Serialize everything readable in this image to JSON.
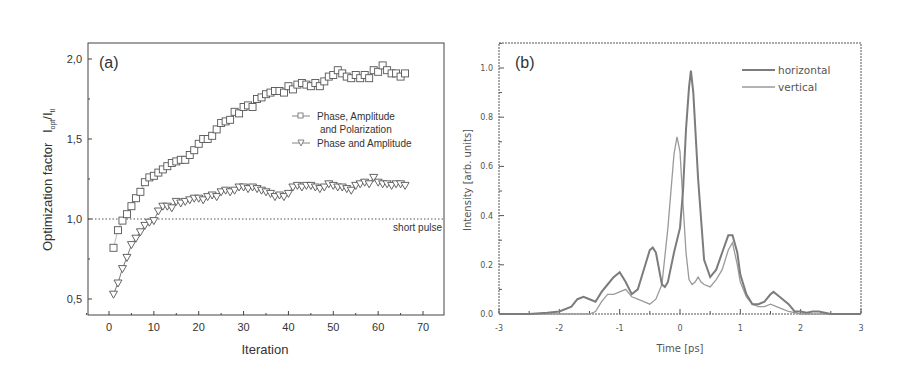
{
  "chart_data": [
    {
      "panel": "(a)",
      "type": "scatter",
      "title": "",
      "panel_label": "(a)",
      "xlabel": "Iteration",
      "ylabel": "Optimization factor  I_opt/I_tl",
      "ylabel_main": "Optimization factor",
      "ylabel_I": "I",
      "ylabel_sub1": "opt",
      "ylabel_sub2": "tl",
      "xlim": [
        -5,
        75
      ],
      "ylim": [
        0.4,
        2.1
      ],
      "xticks": [
        0,
        10,
        20,
        30,
        40,
        50,
        60,
        70
      ],
      "xtick_labels": [
        "0",
        "10",
        "20",
        "30",
        "40",
        "50",
        "60",
        "70"
      ],
      "yticks": [
        0.5,
        1.0,
        1.5,
        2.0
      ],
      "ytick_labels": [
        "0,5",
        "1,0",
        "1,5",
        "2,0"
      ],
      "grid": false,
      "legend_position": "upper right (inside)",
      "reference_line": {
        "y": 1.0,
        "style": "dotted",
        "label": "short pulse"
      },
      "series": [
        {
          "name": "Phase, Amplitude and Polarization",
          "legend_line1": "Phase, Amplitude",
          "legend_line2": "and Polarization",
          "marker": "square",
          "x": [
            1,
            2,
            3,
            4,
            5,
            6,
            7,
            8,
            9,
            10,
            11,
            12,
            13,
            14,
            15,
            16,
            17,
            18,
            19,
            20,
            21,
            22,
            23,
            24,
            25,
            26,
            27,
            28,
            29,
            30,
            31,
            32,
            33,
            34,
            35,
            36,
            37,
            38,
            39,
            40,
            41,
            42,
            43,
            44,
            45,
            46,
            47,
            48,
            49,
            50,
            51,
            52,
            53,
            54,
            55,
            56,
            57,
            58,
            59,
            60,
            61,
            62,
            63,
            64,
            65,
            66
          ],
          "y": [
            0.82,
            0.93,
            0.99,
            1.03,
            1.08,
            1.13,
            1.17,
            1.23,
            1.26,
            1.27,
            1.29,
            1.31,
            1.33,
            1.35,
            1.36,
            1.37,
            1.37,
            1.4,
            1.43,
            1.47,
            1.5,
            1.5,
            1.52,
            1.56,
            1.6,
            1.61,
            1.62,
            1.67,
            1.66,
            1.7,
            1.71,
            1.7,
            1.75,
            1.76,
            1.78,
            1.79,
            1.8,
            1.8,
            1.79,
            1.83,
            1.81,
            1.84,
            1.85,
            1.84,
            1.83,
            1.85,
            1.83,
            1.86,
            1.89,
            1.9,
            1.93,
            1.91,
            1.89,
            1.88,
            1.9,
            1.88,
            1.9,
            1.88,
            1.93,
            1.92,
            1.96,
            1.93,
            1.91,
            1.91,
            1.89,
            1.91
          ]
        },
        {
          "name": "Phase and Amplitude",
          "legend_line1": "Phase and Amplitude",
          "marker": "triangle-down",
          "x": [
            1,
            2,
            3,
            4,
            5,
            6,
            7,
            8,
            9,
            10,
            11,
            12,
            13,
            14,
            15,
            16,
            17,
            18,
            19,
            20,
            21,
            22,
            23,
            24,
            25,
            26,
            27,
            28,
            29,
            30,
            31,
            32,
            33,
            34,
            35,
            36,
            37,
            38,
            39,
            40,
            41,
            42,
            43,
            44,
            45,
            46,
            47,
            48,
            49,
            50,
            51,
            52,
            53,
            54,
            55,
            56,
            57,
            58,
            59,
            60,
            61,
            62,
            63,
            64,
            65,
            66
          ],
          "y": [
            0.53,
            0.6,
            0.69,
            0.76,
            0.84,
            0.88,
            0.92,
            0.96,
            0.98,
            0.99,
            1.05,
            1.08,
            1.08,
            1.07,
            1.11,
            1.1,
            1.11,
            1.12,
            1.13,
            1.13,
            1.12,
            1.14,
            1.15,
            1.14,
            1.17,
            1.18,
            1.17,
            1.18,
            1.2,
            1.2,
            1.19,
            1.2,
            1.19,
            1.18,
            1.17,
            1.16,
            1.14,
            1.15,
            1.14,
            1.16,
            1.2,
            1.21,
            1.2,
            1.21,
            1.21,
            1.2,
            1.19,
            1.2,
            1.22,
            1.21,
            1.2,
            1.2,
            1.19,
            1.18,
            1.21,
            1.22,
            1.23,
            1.22,
            1.26,
            1.23,
            1.22,
            1.22,
            1.21,
            1.22,
            1.22,
            1.21
          ]
        }
      ]
    },
    {
      "panel": "(b)",
      "type": "line",
      "title": "",
      "panel_label": "(b)",
      "xlabel": "Time [ps]",
      "ylabel": "Intensity [arb. units]",
      "xlim": [
        -3,
        3
      ],
      "ylim": [
        0.0,
        1.1
      ],
      "xticks": [
        -3,
        -2,
        -1,
        0,
        1,
        2,
        3
      ],
      "xtick_labels": [
        "-3",
        "-2",
        "-1",
        "0",
        "1",
        "2",
        "3"
      ],
      "yticks": [
        0.0,
        0.2,
        0.4,
        0.6,
        0.8,
        1.0
      ],
      "ytick_labels": [
        "0.0",
        "0.2",
        "0.4",
        "0.6",
        "0.8",
        "1.0"
      ],
      "grid": false,
      "legend_position": "upper right (inside)",
      "series": [
        {
          "name": "horizontal",
          "x": [
            -3.0,
            -2.5,
            -2.2,
            -2.0,
            -1.8,
            -1.7,
            -1.6,
            -1.5,
            -1.4,
            -1.3,
            -1.2,
            -1.1,
            -1.0,
            -0.9,
            -0.8,
            -0.7,
            -0.6,
            -0.5,
            -0.45,
            -0.4,
            -0.3,
            -0.25,
            -0.2,
            -0.1,
            0.0,
            0.05,
            0.1,
            0.15,
            0.18,
            0.22,
            0.3,
            0.4,
            0.5,
            0.6,
            0.7,
            0.8,
            0.87,
            0.95,
            1.0,
            1.1,
            1.2,
            1.3,
            1.4,
            1.5,
            1.55,
            1.6,
            1.7,
            1.8,
            1.9,
            2.0,
            2.1,
            2.2,
            2.3,
            2.4,
            2.5,
            3.0
          ],
          "y": [
            0.0,
            0.0,
            0.005,
            0.01,
            0.03,
            0.06,
            0.07,
            0.06,
            0.05,
            0.09,
            0.12,
            0.15,
            0.17,
            0.13,
            0.08,
            0.1,
            0.18,
            0.26,
            0.27,
            0.25,
            0.12,
            0.11,
            0.13,
            0.25,
            0.35,
            0.5,
            0.75,
            0.92,
            0.99,
            0.9,
            0.55,
            0.22,
            0.15,
            0.18,
            0.25,
            0.32,
            0.32,
            0.25,
            0.16,
            0.08,
            0.04,
            0.04,
            0.05,
            0.08,
            0.09,
            0.08,
            0.06,
            0.04,
            0.01,
            0.01,
            0.005,
            0.01,
            0.01,
            0.005,
            0.0,
            0.0
          ]
        },
        {
          "name": "vertical",
          "x": [
            -3.0,
            -2.0,
            -1.8,
            -1.6,
            -1.5,
            -1.4,
            -1.3,
            -1.2,
            -1.1,
            -1.0,
            -0.9,
            -0.8,
            -0.7,
            -0.6,
            -0.5,
            -0.4,
            -0.3,
            -0.2,
            -0.1,
            -0.05,
            0.0,
            0.05,
            0.1,
            0.15,
            0.2,
            0.25,
            0.3,
            0.35,
            0.4,
            0.5,
            0.6,
            0.7,
            0.8,
            0.87,
            0.95,
            1.0,
            1.1,
            1.2,
            1.3,
            1.4,
            1.5,
            1.6,
            1.7,
            1.8,
            2.0,
            2.5,
            3.0
          ],
          "y": [
            0.0,
            0.0,
            0.0,
            0.0,
            0.0,
            0.01,
            0.05,
            0.08,
            0.08,
            0.09,
            0.1,
            0.07,
            0.06,
            0.05,
            0.04,
            0.06,
            0.12,
            0.35,
            0.65,
            0.72,
            0.66,
            0.45,
            0.25,
            0.14,
            0.12,
            0.13,
            0.15,
            0.13,
            0.12,
            0.11,
            0.14,
            0.18,
            0.26,
            0.29,
            0.2,
            0.13,
            0.07,
            0.04,
            0.03,
            0.03,
            0.04,
            0.03,
            0.02,
            0.01,
            0.0,
            0.0,
            0.0
          ]
        }
      ]
    }
  ]
}
